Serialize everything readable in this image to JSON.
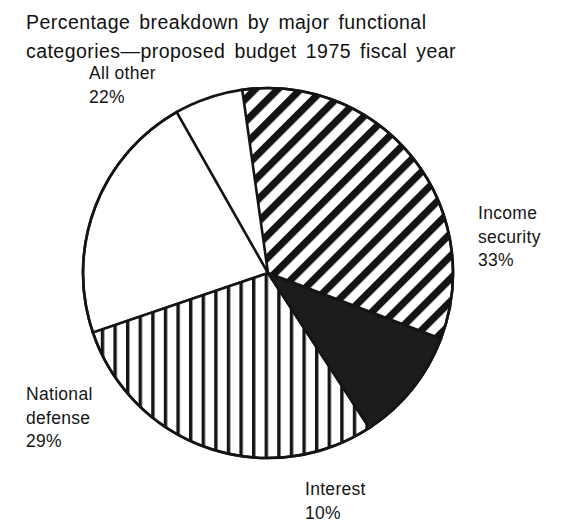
{
  "chart_data": {
    "type": "pie",
    "title": "Percentage breakdown by major functional categories—proposed budget 1975 fiscal year",
    "title_line1": "Percentage breakdown by major functional",
    "title_line2": "categories—proposed budget 1975 fiscal year",
    "xlabel": "",
    "ylabel": "",
    "units": "percent",
    "total": 94,
    "legend": "none (labels placed around pie)",
    "grid": false,
    "categories": [
      "Income security",
      "Interest",
      "National defense",
      "All other"
    ],
    "values": [
      33,
      10,
      29,
      22
    ],
    "slices": [
      {
        "name": "Income security",
        "label_lines": [
          "Income",
          "security",
          "33%"
        ],
        "value": 33,
        "value_text": "33%",
        "fill_pattern": "diagonal-hatch",
        "fill_color": "#ffffff",
        "line_color": "#141414",
        "start_angle_deg": -8,
        "sweep_deg": 118.8,
        "label_position": "right"
      },
      {
        "name": "Interest",
        "label_lines": [
          "Interest",
          "10%"
        ],
        "value": 10,
        "value_text": "10%",
        "fill_pattern": "solid",
        "fill_color": "#1c1c1c",
        "line_color": "#141414",
        "start_angle_deg": 110.8,
        "sweep_deg": 36,
        "label_position": "bottom"
      },
      {
        "name": "National defense",
        "label_lines": [
          "National",
          "defense",
          "29%"
        ],
        "value": 29,
        "value_text": "29%",
        "fill_pattern": "vertical-lines",
        "fill_color": "#ffffff",
        "line_color": "#141414",
        "start_angle_deg": 146.8,
        "sweep_deg": 104.4,
        "label_position": "bottom-left"
      },
      {
        "name": "All other",
        "label_lines": [
          "All other",
          "22%"
        ],
        "value": 22,
        "value_text": "22%",
        "fill_pattern": "none-white",
        "fill_color": "#ffffff",
        "line_color": "#141414",
        "start_angle_deg": 251.2,
        "sweep_deg": 79.2,
        "label_position": "top-left"
      }
    ],
    "geometry": {
      "center_x": 268,
      "center_y": 273,
      "radius": 185
    },
    "colors": {
      "outline": "#141414",
      "background": "#ffffff",
      "text": "#151515",
      "solid_slice": "#1c1c1c"
    }
  }
}
